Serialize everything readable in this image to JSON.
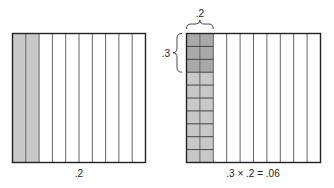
{
  "diagrams": {
    "left": {
      "caption": ".2",
      "columns": 10,
      "shaded_columns": 2,
      "shade_color": "#c8c8c8"
    },
    "right": {
      "caption": ".3 × .2 = .06",
      "columns": 10,
      "rows": 10,
      "shaded_columns": 2,
      "highlight_rows": 3,
      "shade_color": "#c8c8c8",
      "highlight_color": "#a9a9a9",
      "top_brace_label": ".2",
      "side_brace_label": ".3"
    }
  },
  "colors": {
    "line": "#222222",
    "grid": "#555555"
  }
}
